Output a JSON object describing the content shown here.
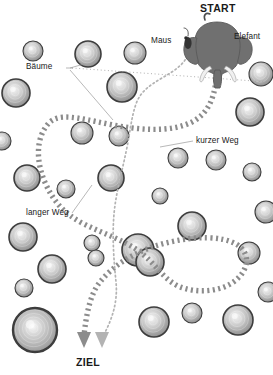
{
  "diagram": {
    "title_start": "START",
    "title_goal": "ZIEL",
    "label_elephant": "Elefant",
    "label_mouse": "Maus",
    "label_trees": "Bäume",
    "label_short_path": "kurzer Weg",
    "label_long_path": "langer Weg",
    "colors": {
      "background": "#ffffff",
      "text": "#1a1a1a",
      "elephant_body": "#707070",
      "elephant_outline": "#4d4d4d",
      "mouse_body": "#333333",
      "thick_path": "#8c8c8c",
      "thin_path": "#b3b3b3",
      "tree_ring": "#3d3d3d",
      "tree_fill_light": "#eaeaea",
      "tree_fill_dark": "#8f8f8f",
      "leader_line": "#9a9a9a"
    }
  },
  "chart_data": {
    "type": "diagram",
    "legend": [
      {
        "name": "Elefant",
        "path": "langer Weg",
        "style": "thick dotted"
      },
      {
        "name": "Maus",
        "path": "kurzer Weg",
        "style": "thin dotted"
      }
    ],
    "annotations": [
      {
        "text": "START",
        "x": 219,
        "y": 8
      },
      {
        "text": "Elefant",
        "x": 236,
        "y": 36
      },
      {
        "text": "Maus",
        "x": 161,
        "y": 41
      },
      {
        "text": "Bäume",
        "x": 33,
        "y": 68
      },
      {
        "text": "kurzer Weg",
        "x": 196,
        "y": 142
      },
      {
        "text": "langer Weg",
        "x": 33,
        "y": 218
      },
      {
        "text": "ZIEL",
        "x": 83,
        "y": 366
      }
    ],
    "trees": [
      {
        "x": 33,
        "y": 51,
        "r": 10
      },
      {
        "x": 88,
        "y": 54,
        "r": 13
      },
      {
        "x": 135,
        "y": 53,
        "r": 11
      },
      {
        "x": 16,
        "y": 93,
        "r": 14
      },
      {
        "x": 261,
        "y": 74,
        "r": 12
      },
      {
        "x": 122,
        "y": 87,
        "r": 15
      },
      {
        "x": 2,
        "y": 141,
        "r": 9
      },
      {
        "x": 82,
        "y": 133,
        "r": 11
      },
      {
        "x": 119,
        "y": 136,
        "r": 10
      },
      {
        "x": 250,
        "y": 112,
        "r": 14
      },
      {
        "x": 178,
        "y": 158,
        "r": 10
      },
      {
        "x": 216,
        "y": 160,
        "r": 10
      },
      {
        "x": 27,
        "y": 178,
        "r": 13
      },
      {
        "x": 252,
        "y": 172,
        "r": 9
      },
      {
        "x": 66,
        "y": 189,
        "r": 9
      },
      {
        "x": 111,
        "y": 178,
        "r": 13
      },
      {
        "x": 160,
        "y": 196,
        "r": 8
      },
      {
        "x": 23,
        "y": 237,
        "r": 14
      },
      {
        "x": 92,
        "y": 243,
        "r": 8
      },
      {
        "x": 138,
        "y": 250,
        "r": 16
      },
      {
        "x": 192,
        "y": 226,
        "r": 14
      },
      {
        "x": 266,
        "y": 212,
        "r": 11
      },
      {
        "x": 249,
        "y": 253,
        "r": 11
      },
      {
        "x": 52,
        "y": 269,
        "r": 14
      },
      {
        "x": 96,
        "y": 258,
        "r": 8
      },
      {
        "x": 150,
        "y": 262,
        "r": 14
      },
      {
        "x": 24,
        "y": 288,
        "r": 9
      },
      {
        "x": 35,
        "y": 330,
        "r": 22
      },
      {
        "x": 154,
        "y": 322,
        "r": 15
      },
      {
        "x": 192,
        "y": 313,
        "r": 10
      },
      {
        "x": 238,
        "y": 320,
        "r": 15
      },
      {
        "x": 268,
        "y": 292,
        "r": 10
      }
    ],
    "long_path_description": "Elefant: trunk at (218,78) → sweeps far left across the forest → loops down-left → swings right → returns left to ZIEL arrow at (84,346)",
    "short_path_description": "Maus: from (190,46) → drops nearly straight down the middle → slight right bow → ZIEL arrow at (101,346)"
  }
}
